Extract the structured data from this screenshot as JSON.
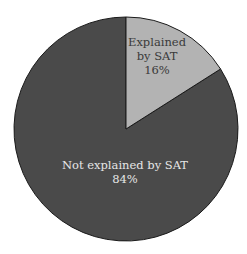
{
  "chart_data": {
    "type": "pie",
    "title": "",
    "categories": [
      "Explained by SAT",
      "Not explained by SAT"
    ],
    "values": [
      16,
      84
    ],
    "units": "%",
    "colors": [
      "#b3b3b3",
      "#4a4a4a"
    ],
    "start_angle_deg": 0,
    "direction": "clockwise",
    "legend": "none",
    "labels": [
      {
        "lines": [
          "Explained",
          "by SAT",
          "16%"
        ],
        "color": "#3a3a3a"
      },
      {
        "lines": [
          "Not explained by SAT",
          "84%"
        ],
        "color": "#e6e6e6"
      }
    ]
  }
}
